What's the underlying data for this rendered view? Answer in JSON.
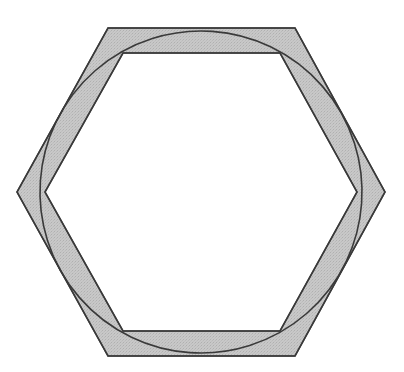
{
  "figure": {
    "title": "Hexagonal annulus with inscribed circle",
    "canvas": {
      "width": 404,
      "height": 372,
      "background_color": "#ffffff"
    },
    "style": {
      "fill_color": "#c8c8c8",
      "stroke_color": "#3a3a3a",
      "stroke_width": 1.6,
      "texture": "stipple",
      "texture_opacity": 0.32,
      "texture_dot_color": "#8a8a8a"
    },
    "center": {
      "x": 201,
      "y": 192
    },
    "outer_hexagon": {
      "name": "outer-hexagon",
      "orientation": "flat-top",
      "circumradius": 184,
      "vertices": [
        {
          "x": 108,
          "y": 28
        },
        {
          "x": 295,
          "y": 28
        },
        {
          "x": 385,
          "y": 192
        },
        {
          "x": 295,
          "y": 356
        },
        {
          "x": 108,
          "y": 356
        },
        {
          "x": 17,
          "y": 192
        }
      ]
    },
    "inner_hexagon": {
      "name": "inner-hexagon",
      "orientation": "flat-top",
      "circumradius": 156,
      "band_thickness": 25,
      "vertices": [
        {
          "x": 123,
          "y": 53
        },
        {
          "x": 280,
          "y": 53
        },
        {
          "x": 357,
          "y": 192
        },
        {
          "x": 280,
          "y": 331
        },
        {
          "x": 123,
          "y": 331
        },
        {
          "x": 45,
          "y": 192
        }
      ]
    },
    "circle": {
      "name": "overlaid-circle",
      "center": {
        "x": 201,
        "y": 192
      },
      "radius": 161,
      "rotation_deg": 4,
      "tangent_points": [
        {
          "x": 201,
          "y": 31,
          "location": "top"
        },
        {
          "x": 201,
          "y": 353,
          "location": "bottom"
        }
      ],
      "extremes": {
        "leftmost_x": 40,
        "rightmost_x": 362,
        "topmost_y": 31,
        "bottommost_y": 353
      }
    }
  }
}
